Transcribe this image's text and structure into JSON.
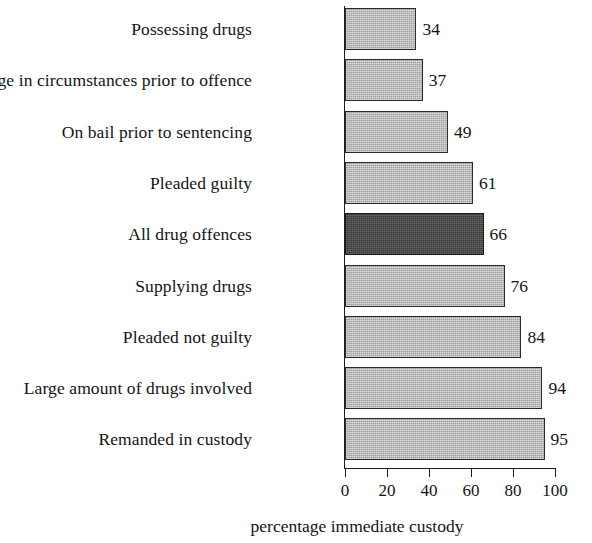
{
  "chart_data": {
    "type": "bar",
    "orientation": "horizontal",
    "title": "",
    "xlabel": "percentage immediate custody",
    "ylabel": "",
    "xlim": [
      0,
      100
    ],
    "xticks": [
      0,
      20,
      40,
      60,
      80,
      100
    ],
    "xtick_labels": [
      "0",
      "20",
      "40",
      "60",
      "80",
      "100"
    ],
    "grid": false,
    "legend": null,
    "categories": [
      "Possessing drugs",
      "Change in circumstances prior to offence",
      "On bail prior to sentencing",
      "Pleaded guilty",
      "All drug offences",
      "Supplying drugs",
      "Pleaded not guilty",
      "Large amount of drugs involved",
      "Remanded in custody"
    ],
    "values": [
      34,
      37,
      49,
      61,
      66,
      76,
      84,
      94,
      95
    ],
    "value_labels": [
      "34",
      "37",
      "49",
      "61",
      "66",
      "76",
      "84",
      "94",
      "95"
    ],
    "highlight_index": 4,
    "bar_color": "#b2b2b2",
    "highlight_color": "#464646",
    "bar_border_color": "#2b2b2b",
    "axis_color": "#1d1d1d",
    "background_color": "#ffffff"
  }
}
